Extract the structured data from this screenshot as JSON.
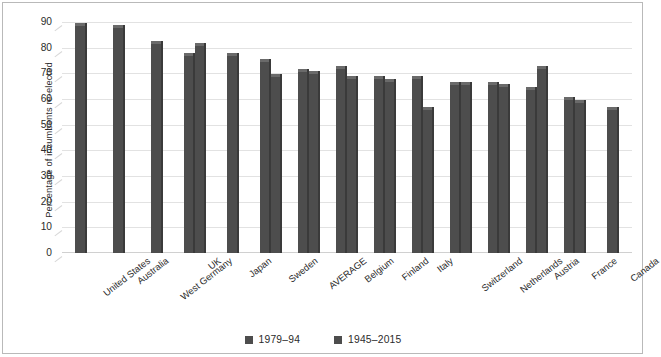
{
  "chart_data": {
    "type": "bar",
    "title": "",
    "subtitle": "",
    "xlabel": "",
    "ylabel": "Percentage of incumbents re-elected",
    "ylim": [
      0,
      90
    ],
    "ytick_step": 10,
    "yticks": [
      90,
      80,
      70,
      60,
      50,
      40,
      30,
      20,
      10,
      0
    ],
    "grid": true,
    "legend_position": "bottom",
    "bar_color": "#4d4d4d",
    "categories": [
      "United States",
      "Australia",
      "West Germany",
      "UK",
      "Japan",
      "Sweden",
      "AVERAGE",
      "Belgium",
      "Finland",
      "Italy",
      "Switzerland",
      "Netherlands",
      "Austria",
      "France",
      "Canada"
    ],
    "series": [
      {
        "name": "1979–94",
        "color": "#4d4d4d",
        "values": [
          89,
          88,
          82,
          77,
          77,
          75,
          71,
          72,
          68,
          68,
          66,
          66,
          64,
          60,
          56
        ]
      },
      {
        "name": "1945–2015",
        "color": "#4d4d4d",
        "values": [
          null,
          null,
          null,
          81,
          null,
          69,
          70,
          68,
          67,
          56,
          66,
          65,
          72,
          59,
          null
        ]
      }
    ]
  },
  "legend": {
    "items": [
      {
        "label": "1979–94",
        "swatch": "legend-swatch-icon"
      },
      {
        "label": "1945–2015",
        "swatch": "legend-swatch-icon"
      }
    ]
  }
}
